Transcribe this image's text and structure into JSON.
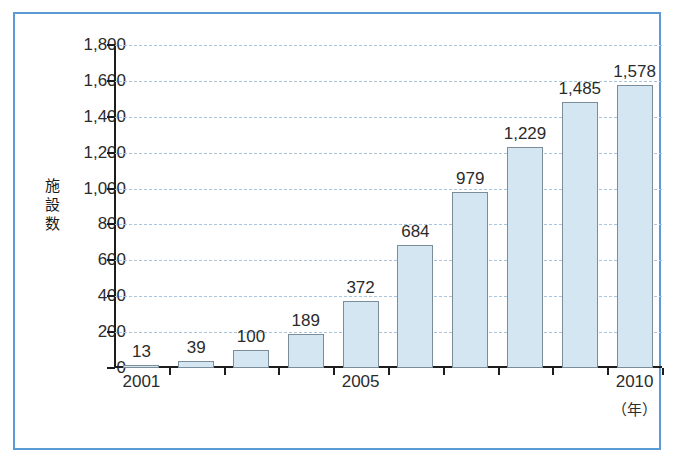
{
  "frame": {
    "border_color": "#5b9bd5",
    "background": "#ffffff"
  },
  "chart_data": {
    "type": "bar",
    "title": "",
    "xlabel": "（年）",
    "ylabel": "施設数",
    "categories": [
      "2001",
      "2002",
      "2003",
      "2004",
      "2005",
      "2006",
      "2007",
      "2008",
      "2009",
      "2010"
    ],
    "values": [
      13,
      39,
      100,
      189,
      372,
      684,
      979,
      1229,
      1485,
      1578
    ],
    "value_labels": [
      "13",
      "39",
      "100",
      "189",
      "372",
      "684",
      "979",
      "1,229",
      "1,485",
      "1,578"
    ],
    "visible_x_tick_labels": [
      "2001",
      "2005",
      "2010"
    ],
    "ylim": [
      0,
      1800
    ],
    "ytick_values": [
      0,
      200,
      400,
      600,
      800,
      1000,
      1200,
      1400,
      1600,
      1800
    ],
    "ytick_labels": [
      "0",
      "200",
      "400",
      "600",
      "800",
      "1,000",
      "1,200",
      "1,400",
      "1,600",
      "1,800"
    ],
    "grid": true,
    "grid_style": "dashed",
    "grid_color": "#a9c5dd",
    "legend": "none",
    "bar_fill_color": "#d3e6f1",
    "bar_border_color": "#7a8d98",
    "axis_color": "#1d1d1d"
  }
}
